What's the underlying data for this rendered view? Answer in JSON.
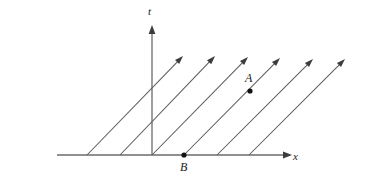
{
  "figure": {
    "width": 367,
    "height": 182,
    "background_color": "#ffffff"
  },
  "axes": {
    "line_color": "#6b6b6b",
    "horizontal": {
      "label": "x",
      "label_x": 293,
      "label_y": 151,
      "x1": 57,
      "y1": 155,
      "x2": 288,
      "y2": 155,
      "arrow_tip_x": 292,
      "arrow_tip_y": 155
    },
    "vertical": {
      "label": "t",
      "label_x": 148,
      "label_y": 6,
      "x1": 152,
      "y1": 155,
      "x2": 152,
      "y2": 29,
      "arrow_tip_x": 152,
      "arrow_tip_y": 25
    }
  },
  "vector_field": {
    "count": 6,
    "line_color": "#5a5a5a",
    "arrow_color": "#3c3c3c",
    "description": "six parallel arrows of slope approximately 1, drawn upward to the right",
    "lines": [
      {
        "name": "worldline-1",
        "x_start": 87,
        "y_start": 155,
        "x_tip": 183,
        "y_tip": 56
      },
      {
        "name": "worldline-2",
        "x_start": 120,
        "y_start": 155,
        "x_tip": 215,
        "y_tip": 56
      },
      {
        "name": "worldline-3",
        "x_start": 152,
        "y_start": 155,
        "x_tip": 248,
        "y_tip": 57
      },
      {
        "name": "worldline-4",
        "x_start": 184,
        "y_start": 155,
        "x_tip": 280,
        "y_tip": 58
      },
      {
        "name": "worldline-5",
        "x_start": 217,
        "y_start": 155,
        "x_tip": 313,
        "y_tip": 59
      },
      {
        "name": "worldline-6",
        "x_start": 249,
        "y_start": 155,
        "x_tip": 345,
        "y_tip": 59
      }
    ]
  },
  "events": [
    {
      "label": "A",
      "dot_x": 250,
      "dot_y": 91,
      "dot_radius": 2.6,
      "label_x": 245,
      "label_y": 72
    },
    {
      "label": "B",
      "dot_x": 184,
      "dot_y": 155,
      "dot_radius": 2.6,
      "label_x": 180,
      "label_y": 161
    }
  ]
}
